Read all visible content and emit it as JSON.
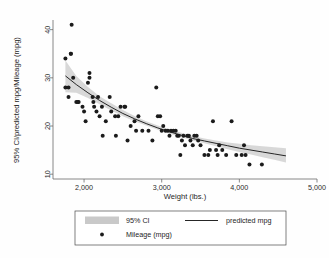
{
  "chart_data": {
    "type": "scatter",
    "title": "",
    "xlabel": "Weight (lbs.)",
    "ylabel": "95% CI/predicted mpg/Mileage (mpg)",
    "xlim": [
      1600,
      5000
    ],
    "ylim": [
      9,
      42
    ],
    "xticks": [
      2000,
      3000,
      4000,
      5000
    ],
    "xticklabels": [
      "2,000",
      "3,000",
      "4,000",
      "5,000"
    ],
    "yticks": [
      10,
      20,
      30,
      40
    ],
    "yticklabels": [
      "10",
      "20",
      "30",
      "40"
    ],
    "grid": false,
    "legend_position": "below-plot",
    "legend": [
      {
        "key": "ci",
        "label": "95% CI",
        "marker": "band",
        "color": "#c9c9c9"
      },
      {
        "key": "predicted",
        "label": "predicted mpg",
        "marker": "line",
        "color": "#262626"
      },
      {
        "key": "mileage",
        "label": "Mileage (mpg)",
        "marker": "dot",
        "color": "#1b1b1b"
      }
    ],
    "series": [
      {
        "name": "Mileage (mpg)",
        "type": "scatter",
        "points": [
          [
            1760,
            34
          ],
          [
            1760,
            28
          ],
          [
            1800,
            28
          ],
          [
            1800,
            26
          ],
          [
            1830,
            35
          ],
          [
            1830,
            35
          ],
          [
            1840,
            41
          ],
          [
            1860,
            30
          ],
          [
            1900,
            25
          ],
          [
            1920,
            25
          ],
          [
            1930,
            25
          ],
          [
            1980,
            24
          ],
          [
            2000,
            23
          ],
          [
            2020,
            21
          ],
          [
            2050,
            29
          ],
          [
            2070,
            30
          ],
          [
            2070,
            31
          ],
          [
            2110,
            26
          ],
          [
            2120,
            25
          ],
          [
            2130,
            24
          ],
          [
            2160,
            23
          ],
          [
            2180,
            26
          ],
          [
            2200,
            22
          ],
          [
            2230,
            24
          ],
          [
            2240,
            18
          ],
          [
            2280,
            21
          ],
          [
            2330,
            26
          ],
          [
            2350,
            23
          ],
          [
            2400,
            22
          ],
          [
            2410,
            18
          ],
          [
            2440,
            22
          ],
          [
            2470,
            24
          ],
          [
            2520,
            24
          ],
          [
            2530,
            24
          ],
          [
            2560,
            17
          ],
          [
            2600,
            20
          ],
          [
            2650,
            21
          ],
          [
            2670,
            19
          ],
          [
            2700,
            22
          ],
          [
            2750,
            19
          ],
          [
            2830,
            19
          ],
          [
            2880,
            17
          ],
          [
            2930,
            28
          ],
          [
            2950,
            22
          ],
          [
            2980,
            22
          ],
          [
            3000,
            19
          ],
          [
            3020,
            20
          ],
          [
            3050,
            19
          ],
          [
            3080,
            19
          ],
          [
            3100,
            18
          ],
          [
            3120,
            19
          ],
          [
            3150,
            19
          ],
          [
            3180,
            19
          ],
          [
            3200,
            18
          ],
          [
            3220,
            18
          ],
          [
            3240,
            14
          ],
          [
            3260,
            17
          ],
          [
            3280,
            18
          ],
          [
            3300,
            16
          ],
          [
            3330,
            18
          ],
          [
            3350,
            18
          ],
          [
            3370,
            17
          ],
          [
            3400,
            16
          ],
          [
            3420,
            18
          ],
          [
            3450,
            18
          ],
          [
            3470,
            17
          ],
          [
            3500,
            16
          ],
          [
            3550,
            14
          ],
          [
            3600,
            14
          ],
          [
            3620,
            15
          ],
          [
            3660,
            21
          ],
          [
            3700,
            15
          ],
          [
            3720,
            14
          ],
          [
            3740,
            16
          ],
          [
            3780,
            15
          ],
          [
            3830,
            14
          ],
          [
            3900,
            21
          ],
          [
            3960,
            14
          ],
          [
            4030,
            14
          ],
          [
            4060,
            16
          ],
          [
            4080,
            14
          ],
          [
            4130,
            12
          ],
          [
            4290,
            12
          ]
        ]
      }
    ],
    "fit": {
      "name": "predicted mpg",
      "type": "line",
      "points": [
        [
          1760,
          30.4
        ],
        [
          1900,
          28.6
        ],
        [
          2050,
          26.9
        ],
        [
          2200,
          25.3
        ],
        [
          2350,
          23.9
        ],
        [
          2500,
          22.6
        ],
        [
          2650,
          21.5
        ],
        [
          2800,
          20.5
        ],
        [
          2950,
          19.6
        ],
        [
          3100,
          18.8
        ],
        [
          3250,
          18.1
        ],
        [
          3400,
          17.4
        ],
        [
          3550,
          16.9
        ],
        [
          3700,
          16.4
        ],
        [
          3850,
          15.9
        ],
        [
          4000,
          15.4
        ],
        [
          4150,
          15.0
        ],
        [
          4300,
          14.6
        ],
        [
          4450,
          14.2
        ],
        [
          4600,
          13.8
        ]
      ]
    },
    "ci_band": {
      "name": "95% CI",
      "lower": [
        [
          1760,
          27.0
        ],
        [
          1900,
          26.9
        ],
        [
          2050,
          25.8
        ],
        [
          2200,
          24.5
        ],
        [
          2350,
          23.2
        ],
        [
          2500,
          22.0
        ],
        [
          2650,
          21.0
        ],
        [
          2800,
          20.1
        ],
        [
          2950,
          19.2
        ],
        [
          3100,
          18.4
        ],
        [
          3250,
          17.7
        ],
        [
          3400,
          17.0
        ],
        [
          3550,
          16.4
        ],
        [
          3700,
          15.8
        ],
        [
          3850,
          15.2
        ],
        [
          4000,
          14.6
        ],
        [
          4150,
          14.1
        ],
        [
          4300,
          13.5
        ],
        [
          4450,
          13.0
        ],
        [
          4600,
          12.4
        ]
      ],
      "upper": [
        [
          1760,
          33.6
        ],
        [
          1900,
          30.4
        ],
        [
          2050,
          28.1
        ],
        [
          2200,
          26.2
        ],
        [
          2350,
          24.7
        ],
        [
          2500,
          23.3
        ],
        [
          2650,
          22.1
        ],
        [
          2800,
          21.0
        ],
        [
          2950,
          20.1
        ],
        [
          3100,
          19.3
        ],
        [
          3250,
          18.6
        ],
        [
          3400,
          17.9
        ],
        [
          3550,
          17.4
        ],
        [
          3700,
          17.0
        ],
        [
          3850,
          16.6
        ],
        [
          4000,
          16.3
        ],
        [
          4150,
          16.0
        ],
        [
          4300,
          15.8
        ],
        [
          4450,
          15.6
        ],
        [
          4600,
          15.4
        ]
      ]
    }
  }
}
